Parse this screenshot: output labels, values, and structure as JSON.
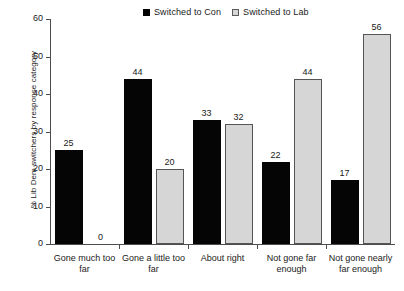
{
  "chart_data": {
    "type": "bar",
    "title": "",
    "xlabel": "",
    "ylabel": "% Lib Dem switchers by response category",
    "ylim": [
      0,
      60
    ],
    "ytick_step": 10,
    "yticks": [
      0,
      10,
      20,
      30,
      40,
      50,
      60
    ],
    "grid": false,
    "legend_position": "top-center",
    "categories": [
      "Gone much too far",
      "Gone a little too far",
      "About right",
      "Not gone far enough",
      "Not gone nearly far enough"
    ],
    "series": [
      {
        "name": "Switched to Con",
        "color": "#050505",
        "values": [
          25,
          44,
          33,
          22,
          17
        ]
      },
      {
        "name": "Switched to Lab",
        "color": "#d6d6d6",
        "values": [
          0,
          20,
          32,
          44,
          56
        ]
      }
    ]
  },
  "legend": {
    "items": [
      {
        "label": "Switched to Con",
        "swatch": "filled-black-square"
      },
      {
        "label": "Switched to Lab",
        "swatch": "open-gray-square"
      }
    ]
  },
  "axes": {
    "y_title": "% Lib Dem switchers by response category",
    "y_tick_labels": [
      "60",
      "50",
      "40",
      "30",
      "20",
      "10",
      "0"
    ],
    "x_tick_labels": [
      "Gone much too far",
      "Gone a little too far",
      "About right",
      "Not gone far enough",
      "Not gone nearly far enough"
    ]
  },
  "bar_labels": {
    "con": [
      "25",
      "44",
      "33",
      "22",
      "17"
    ],
    "lab": [
      "0",
      "20",
      "32",
      "44",
      "56"
    ]
  },
  "colors": {
    "con_bar": "#050505",
    "lab_bar": "#d6d6d6",
    "lab_bar_border": "#555555",
    "axis": "#4d4d4d",
    "text": "#1a1a1a",
    "background": "#ffffff"
  }
}
